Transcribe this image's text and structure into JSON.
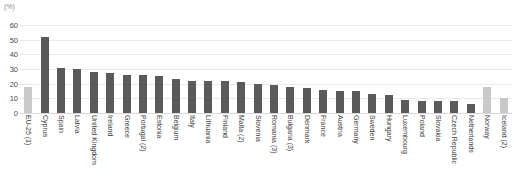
{
  "chart_data": {
    "type": "bar",
    "title": "",
    "subtitle": "",
    "xlabel": "",
    "ylabel": "(%)",
    "unit_label": "(%)",
    "ylim": [
      0,
      60
    ],
    "ytick_step": 10,
    "yticks": [
      "0",
      "10",
      "20",
      "30",
      "40",
      "50",
      "60"
    ],
    "grid": true,
    "legend": "none",
    "categories": [
      "EU-25 (1)",
      "Cyprus",
      "Spain",
      "Latvia",
      "United Kingdom",
      "Ireland",
      "Greece",
      "Portugal (2)",
      "Estonia",
      "Belgium",
      "Italy",
      "Lithuania",
      "Finland",
      "Malta (2)",
      "Slovenia",
      "Romania (3)",
      "Bulgaria (3)",
      "Denmark",
      "France",
      "Austria",
      "Germany",
      "Sweden",
      "Hungary",
      "Luxembourg",
      "Poland",
      "Slovakia",
      "Czech Republic",
      "Netherlands",
      "Norway",
      "Iceland (2)"
    ],
    "values": [
      18,
      52,
      31,
      30,
      28,
      27,
      26,
      26,
      25,
      23,
      22,
      22,
      22,
      21,
      20,
      19,
      18,
      17,
      16,
      15,
      15,
      13,
      12,
      9,
      8,
      8,
      8,
      6,
      18,
      10
    ],
    "bar_styles": [
      "light",
      "dark",
      "dark",
      "dark",
      "dark",
      "dark",
      "dark",
      "dark",
      "dark",
      "dark",
      "dark",
      "dark",
      "dark",
      "dark",
      "dark",
      "dark",
      "dark",
      "dark",
      "dark",
      "dark",
      "dark",
      "dark",
      "dark",
      "dark",
      "dark",
      "dark",
      "dark",
      "dark",
      "light",
      "light"
    ],
    "colors": {
      "bar_dark": "#5a5a5a",
      "bar_light": "#c9c9c9",
      "gridline": "#e9e9e9",
      "baseline": "#d9d9d9",
      "tick_text": "#4a4a4a",
      "category_text": "#3c3c3c",
      "unit_text": "#8a8a8a",
      "background": "#ffffff"
    }
  }
}
